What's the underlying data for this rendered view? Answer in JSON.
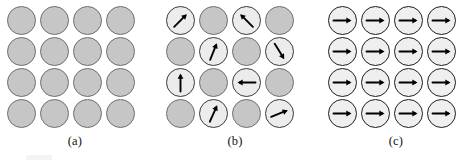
{
  "figure": {
    "type": "diagram",
    "colors": {
      "dark_circle_fill": "#c6c6c6",
      "dark_circle_stroke": "#6f6f6f",
      "light_circle_fill": "#ececec",
      "light_circle_stroke": "#3a3a3a",
      "plain_circle_fill": "#efefef",
      "plain_circle_stroke": "#1e1e1e",
      "arrow_color": "#000000",
      "background": "#ffffff",
      "caption_color": "#111111"
    },
    "grid": {
      "rows": 4,
      "cols": 4
    }
  },
  "panels": [
    {
      "id": "a",
      "caption": "(a)",
      "style": "all-gray-no-arrows",
      "cells": [
        {
          "shade": "dark",
          "arrow": null
        },
        {
          "shade": "dark",
          "arrow": null
        },
        {
          "shade": "dark",
          "arrow": null
        },
        {
          "shade": "dark",
          "arrow": null
        },
        {
          "shade": "dark",
          "arrow": null
        },
        {
          "shade": "dark",
          "arrow": null
        },
        {
          "shade": "dark",
          "arrow": null
        },
        {
          "shade": "dark",
          "arrow": null
        },
        {
          "shade": "dark",
          "arrow": null
        },
        {
          "shade": "dark",
          "arrow": null
        },
        {
          "shade": "dark",
          "arrow": null
        },
        {
          "shade": "dark",
          "arrow": null
        },
        {
          "shade": "dark",
          "arrow": null
        },
        {
          "shade": "dark",
          "arrow": null
        },
        {
          "shade": "dark",
          "arrow": null
        },
        {
          "shade": "dark",
          "arrow": null
        }
      ]
    },
    {
      "id": "b",
      "caption": "(b)",
      "style": "checkerboard-random-arrows",
      "cells": [
        {
          "shade": "light",
          "arrow": 45
        },
        {
          "shade": "dark",
          "arrow": null
        },
        {
          "shade": "light",
          "arrow": 135
        },
        {
          "shade": "dark",
          "arrow": null
        },
        {
          "shade": "dark",
          "arrow": null
        },
        {
          "shade": "light",
          "arrow": 68
        },
        {
          "shade": "dark",
          "arrow": null
        },
        {
          "shade": "light",
          "arrow": -58
        },
        {
          "shade": "light",
          "arrow": 90
        },
        {
          "shade": "dark",
          "arrow": null
        },
        {
          "shade": "light",
          "arrow": 180
        },
        {
          "shade": "dark",
          "arrow": null
        },
        {
          "shade": "dark",
          "arrow": null
        },
        {
          "shade": "light",
          "arrow": 66
        },
        {
          "shade": "dark",
          "arrow": null
        },
        {
          "shade": "light",
          "arrow": 22
        }
      ]
    },
    {
      "id": "c",
      "caption": "(c)",
      "style": "all-light-aligned-arrows",
      "cells": [
        {
          "shade": "plain",
          "arrow": 0
        },
        {
          "shade": "plain",
          "arrow": 0
        },
        {
          "shade": "plain",
          "arrow": 0
        },
        {
          "shade": "plain",
          "arrow": 0
        },
        {
          "shade": "plain",
          "arrow": 0
        },
        {
          "shade": "plain",
          "arrow": 0
        },
        {
          "shade": "plain",
          "arrow": 0
        },
        {
          "shade": "plain",
          "arrow": 0
        },
        {
          "shade": "plain",
          "arrow": 0
        },
        {
          "shade": "plain",
          "arrow": 0
        },
        {
          "shade": "plain",
          "arrow": 0
        },
        {
          "shade": "plain",
          "arrow": 0
        },
        {
          "shade": "plain",
          "arrow": 0
        },
        {
          "shade": "plain",
          "arrow": 0
        },
        {
          "shade": "plain",
          "arrow": 0
        },
        {
          "shade": "plain",
          "arrow": 0
        }
      ]
    }
  ]
}
